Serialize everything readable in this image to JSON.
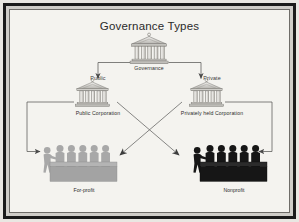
{
  "slide": {
    "title": "Governance Types",
    "background_color": "#f4f3ef",
    "frame_color": "#1b1b1b"
  },
  "nodes": {
    "governance": {
      "label": "Governance",
      "icon": "bank-building-icon",
      "top_label": ""
    },
    "public": {
      "top_label": "Public",
      "label": "Public Corporation",
      "icon": "bank-building-icon"
    },
    "private": {
      "top_label": "Private",
      "label": "Privately held Corporation",
      "icon": "bank-building-icon"
    },
    "for_profit": {
      "label": "For-profit",
      "icon": "people-group-icon",
      "color": "#a8a8a8"
    },
    "nonprofit": {
      "label": "Nonprofit",
      "icon": "people-group-icon",
      "color": "#1a1a1a"
    }
  },
  "connectors": [
    {
      "name": "governance-to-public",
      "from": "governance",
      "to": "public",
      "style": "elbow",
      "arrow": "end"
    },
    {
      "name": "governance-to-private",
      "from": "governance",
      "to": "private",
      "style": "elbow",
      "arrow": "end"
    },
    {
      "name": "public-to-for-profit",
      "from": "public",
      "to": "for_profit",
      "style": "elbow",
      "arrow": "end"
    },
    {
      "name": "private-to-nonprofit",
      "from": "private",
      "to": "nonprofit",
      "style": "elbow",
      "arrow": "end"
    },
    {
      "name": "public-to-nonprofit",
      "from": "public",
      "to": "nonprofit",
      "style": "diagonal",
      "arrow": "end"
    },
    {
      "name": "private-to-for-profit",
      "from": "private",
      "to": "for_profit",
      "style": "diagonal",
      "arrow": "end"
    }
  ]
}
